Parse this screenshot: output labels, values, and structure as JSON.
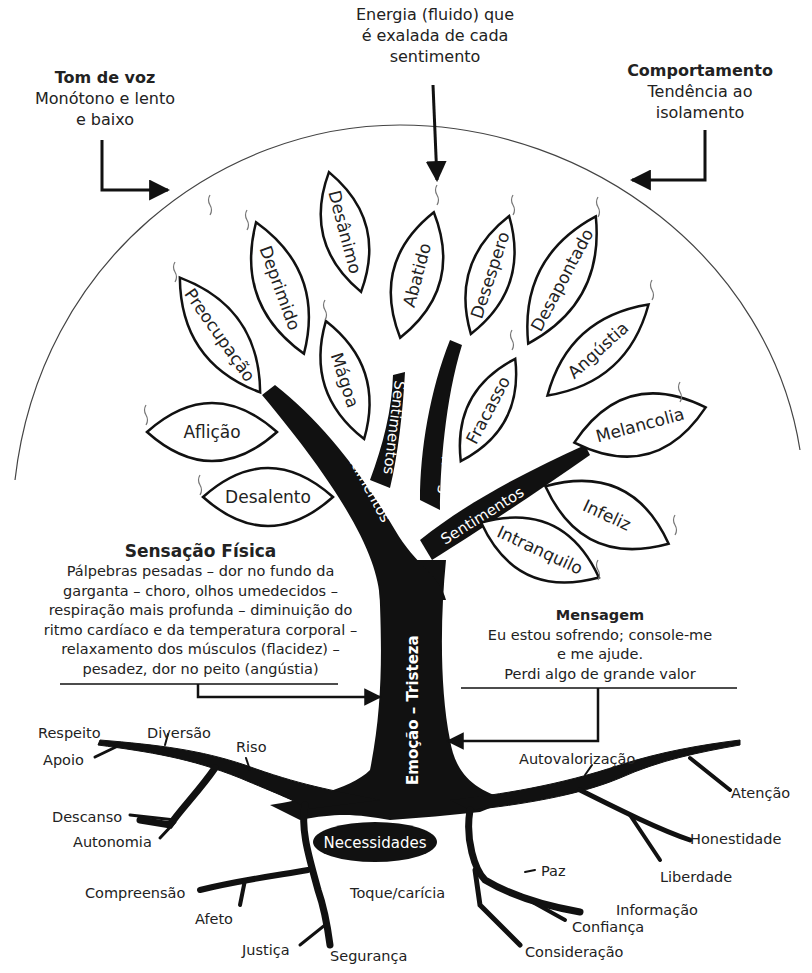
{
  "annotations": {
    "energy": {
      "lines": [
        "Energia (fluido) que",
        "é exalada de cada",
        "sentimento"
      ]
    },
    "tone": {
      "title": "Tom de voz",
      "lines": [
        "Monótono e lento",
        "e baixo"
      ]
    },
    "behavior": {
      "title": "Comportamento",
      "lines": [
        "Tendência ao",
        "isolamento"
      ]
    },
    "sensation": {
      "title": "Sensação Física",
      "lines": [
        "Pálpebras pesadas – dor no fundo da",
        "garganta – choro, olhos umedecidos –",
        "respiração mais profunda – diminuição do",
        "ritmo cardíaco e da temperatura corporal –",
        "relaxamento dos músculos (flacidez) –",
        "pesadez, dor no peito (angústia)"
      ]
    },
    "message": {
      "title": "Mensagem",
      "lines": [
        "Eu estou sofrendo; console-me",
        "e me ajude.",
        "Perdi algo de grande valor"
      ]
    }
  },
  "trunk": {
    "label": "Emoção – Tristeza"
  },
  "branches": {
    "label": "Sentimentos"
  },
  "roots_label": "Necessidades",
  "leaves": [
    {
      "label": "Preocupação"
    },
    {
      "label": "Deprimido"
    },
    {
      "label": "Desânimo"
    },
    {
      "label": "Abatido"
    },
    {
      "label": "Desespero"
    },
    {
      "label": "Desapontado"
    },
    {
      "label": "Angústia"
    },
    {
      "label": "Mágoa"
    },
    {
      "label": "Fracasso"
    },
    {
      "label": "Aflição"
    },
    {
      "label": "Desalento"
    },
    {
      "label": "Melancolia"
    },
    {
      "label": "Infeliz"
    },
    {
      "label": "Intranquilo"
    }
  ],
  "needs": [
    {
      "label": "Respeito"
    },
    {
      "label": "Diversão"
    },
    {
      "label": "Riso"
    },
    {
      "label": "Apoio"
    },
    {
      "label": "Descanso"
    },
    {
      "label": "Autonomia"
    },
    {
      "label": "Compreensão"
    },
    {
      "label": "Afeto"
    },
    {
      "label": "Justiça"
    },
    {
      "label": "Segurança"
    },
    {
      "label": "Toque/carícia"
    },
    {
      "label": "Paz"
    },
    {
      "label": "Informação"
    },
    {
      "label": "Confiança"
    },
    {
      "label": "Consideração"
    },
    {
      "label": "Autovalorização"
    },
    {
      "label": "Atenção"
    },
    {
      "label": "Honestidade"
    },
    {
      "label": "Liberdade"
    }
  ]
}
